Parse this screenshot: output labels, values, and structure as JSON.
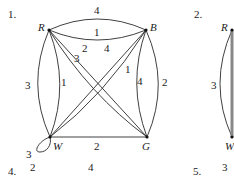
{
  "figures": [
    {
      "number": "1.",
      "vertices": [
        {
          "id": "R",
          "label": "R"
        },
        {
          "id": "B",
          "label": "B"
        },
        {
          "id": "W",
          "label": "W"
        },
        {
          "id": "G",
          "label": "G"
        }
      ],
      "edges": [
        {
          "from": "R",
          "to": "B",
          "weight": "4",
          "style": "outer-curve"
        },
        {
          "from": "R",
          "to": "B",
          "weight": "1",
          "style": "inner-curve"
        },
        {
          "from": "R",
          "to": "W",
          "weight": "3",
          "style": "outer-curve"
        },
        {
          "from": "R",
          "to": "W",
          "weight": "1",
          "style": "inner-curve"
        },
        {
          "from": "B",
          "to": "G",
          "weight": "4",
          "style": "inner-curve"
        },
        {
          "from": "B",
          "to": "G",
          "weight": "2",
          "style": "outer-curve"
        },
        {
          "from": "W",
          "to": "G",
          "weight": "2",
          "style": "straight"
        },
        {
          "from": "R",
          "to": "G",
          "weight": "2",
          "style": "diagonal"
        },
        {
          "from": "R",
          "to": "G",
          "weight": "3",
          "style": "diagonal"
        },
        {
          "from": "B",
          "to": "W",
          "weight": "4",
          "style": "diagonal"
        },
        {
          "from": "B",
          "to": "W",
          "weight": "1",
          "style": "diagonal"
        },
        {
          "from": "W",
          "to": "W",
          "weight": "3",
          "style": "loop"
        }
      ]
    },
    {
      "number": "2.",
      "vertices": [
        {
          "id": "R",
          "label": "R"
        },
        {
          "id": "W",
          "label": "W"
        }
      ],
      "edges": [
        {
          "from": "R",
          "to": "W",
          "weight": "3",
          "style": "outer-curve"
        }
      ]
    },
    {
      "number": "4.",
      "visible_weights": [
        "2",
        "4"
      ]
    },
    {
      "number": "5.",
      "visible_weights": [
        "3"
      ]
    }
  ]
}
